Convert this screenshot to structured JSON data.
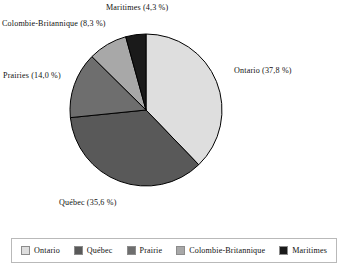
{
  "chart_data": {
    "type": "pie",
    "title": "",
    "categories": [
      "Ontario",
      "Québec",
      "Prairies",
      "Colombie-Britannique",
      "Maritimes"
    ],
    "values": [
      37.8,
      35.6,
      14.0,
      8.3,
      4.3
    ],
    "unit": "%",
    "decimal_separator": ",",
    "start_angle_deg": 0,
    "direction": "clockwise",
    "legend_position": "bottom",
    "grid": false,
    "slices": [
      {
        "label": "Ontario",
        "value": 37.8,
        "color": "#dedede",
        "callout": "Ontario (37,8 %)"
      },
      {
        "label": "Québec",
        "value": 35.6,
        "color": "#595959",
        "callout": "Québec (35,6 %)"
      },
      {
        "label": "Prairies",
        "value": 14.0,
        "color": "#6e6e6e",
        "callout": "Prairies (14,0 %)"
      },
      {
        "label": "Colombie-Britannique",
        "value": 8.3,
        "color": "#a8a8a8",
        "callout": "Colombie-Britannique (8,3 %)"
      },
      {
        "label": "Maritimes",
        "value": 4.3,
        "color": "#1a1a1a",
        "callout": "Maritimes (4,3 %)"
      }
    ]
  },
  "labels": {
    "ontario": "Ontario (37,8 %)",
    "quebec": "Québec (35,6 %)",
    "prairies": "Prairies (14,0 %)",
    "colombie_britannique": "Colombie-Britannique (8,3 %)",
    "maritimes": "Maritimes (4,3 %)"
  },
  "legend": {
    "items": [
      {
        "label": "Ontario",
        "color": "#dedede"
      },
      {
        "label": "Québec",
        "color": "#595959"
      },
      {
        "label": "Prairie",
        "color": "#6e6e6e"
      },
      {
        "label": "Colombie-Britannique",
        "color": "#a8a8a8"
      },
      {
        "label": "Maritimes",
        "color": "#1a1a1a"
      }
    ]
  },
  "colors": {
    "background": "#ffffff",
    "outline": "#000000",
    "legend_border": "#b9b9b9",
    "text": "#111111"
  }
}
